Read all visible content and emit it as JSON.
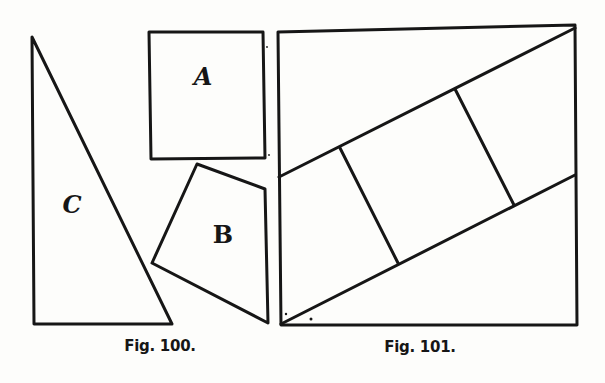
{
  "figures": [
    {
      "caption": "Fig. 100.",
      "caption_pos": [
        160,
        346
      ],
      "shapes": [
        {
          "name": "triangle-c",
          "label": "C",
          "label_pos": [
            72,
            205
          ],
          "points": [
            [
              32,
              37
            ],
            [
              34,
              324
            ],
            [
              172,
              324
            ]
          ]
        },
        {
          "name": "square-a",
          "label": "A",
          "label_pos": [
            203,
            77
          ],
          "points": [
            [
              149,
              32
            ],
            [
              263,
              32
            ],
            [
              265,
              158
            ],
            [
              151,
              159
            ]
          ]
        },
        {
          "name": "quad-b",
          "label": "B",
          "label_pos": [
            223,
            235
          ],
          "points": [
            [
              197,
              164
            ],
            [
              265,
              189
            ],
            [
              268,
              323
            ],
            [
              152,
              263
            ]
          ]
        }
      ]
    },
    {
      "caption": "Fig. 101.",
      "caption_pos": [
        420,
        347
      ],
      "square": [
        [
          278,
          32
        ],
        [
          575,
          25
        ],
        [
          577,
          325
        ],
        [
          281,
          325
        ]
      ],
      "lines": [
        {
          "name": "upper-diagonal",
          "from": [
            279,
            177
          ],
          "to": [
            575,
            28
          ]
        },
        {
          "name": "lower-diagonal",
          "from": [
            281,
            324
          ],
          "to": [
            575,
            175
          ]
        },
        {
          "name": "cross-line-1",
          "from": [
            340,
            148
          ],
          "to": [
            398,
            263
          ]
        },
        {
          "name": "cross-line-2",
          "from": [
            455,
            89
          ],
          "to": [
            514,
            205
          ]
        }
      ]
    }
  ],
  "labels": {
    "a": "A",
    "b": "B",
    "c": "C",
    "fig100": "Fig. 100.",
    "fig101": "Fig. 101."
  },
  "colors": {
    "ink": "#161616",
    "paper": "#fdfdfb"
  }
}
